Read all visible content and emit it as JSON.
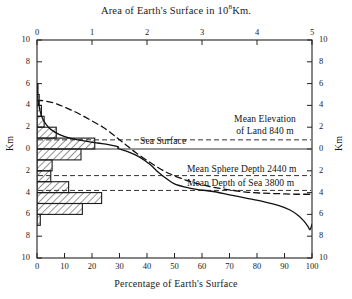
{
  "chart_data": {
    "type": "area",
    "xlabel": "Percentage of Earth's Surface",
    "ylabel": "Km",
    "ylabel_right": "Km",
    "xlim": [
      0,
      100
    ],
    "ylim": [
      -10,
      10
    ],
    "grid": false,
    "legend": "none",
    "top_axis": {
      "label": "Area of Earth's Surface in 10⁸Km.",
      "ticks": [
        "0",
        "1",
        "2",
        "3",
        "4",
        "5"
      ],
      "values": [
        0,
        1,
        2,
        3,
        4,
        5
      ],
      "range": [
        0,
        5
      ]
    },
    "bottom_axis": {
      "label": "Percentage of Earth's Surface",
      "ticks": [
        "0",
        "10",
        "20",
        "30",
        "40",
        "50",
        "60",
        "70",
        "80",
        "90",
        "100"
      ],
      "values": [
        0,
        10,
        20,
        30,
        40,
        50,
        60,
        70,
        80,
        90,
        100
      ],
      "range": [
        0,
        100
      ]
    },
    "left_axis": {
      "label": "Km",
      "ticks": [
        "10",
        "8",
        "6",
        "4",
        "2",
        "0",
        "2",
        "4",
        "6",
        "8",
        "10"
      ],
      "values": [
        10,
        8,
        6,
        4,
        2,
        0,
        -2,
        -4,
        -6,
        -8,
        -10
      ]
    },
    "right_axis": {
      "label": "Km",
      "ticks": [
        "10",
        "8",
        "6",
        "4",
        "2",
        "0",
        "2",
        "4",
        "6",
        "8",
        "10"
      ],
      "values": [
        10,
        8,
        6,
        4,
        2,
        0,
        -2,
        -4,
        -6,
        -8,
        -10
      ]
    },
    "series": [
      {
        "name": "Hypsographic curve (cumulative percentage of Earth's surface vs elevation)",
        "style": "solid",
        "points": [
          [
            0.0,
            5.5
          ],
          [
            0.3,
            4.6
          ],
          [
            0.7,
            4.0
          ],
          [
            1.2,
            3.4
          ],
          [
            2.0,
            2.8
          ],
          [
            3.2,
            2.3
          ],
          [
            5.0,
            1.8
          ],
          [
            8.0,
            1.35
          ],
          [
            12.0,
            1.0
          ],
          [
            17.0,
            0.75
          ],
          [
            22.0,
            0.55
          ],
          [
            26.0,
            0.4
          ],
          [
            29.5,
            0.2
          ],
          [
            29.5,
            0.05
          ],
          [
            33.0,
            -0.25
          ],
          [
            37.0,
            -0.7
          ],
          [
            41.0,
            -1.4
          ],
          [
            44.0,
            -2.1
          ],
          [
            47.0,
            -2.7
          ],
          [
            50.0,
            -3.2
          ],
          [
            54.0,
            -3.5
          ],
          [
            58.0,
            -3.7
          ],
          [
            64.0,
            -3.9
          ],
          [
            70.0,
            -4.2
          ],
          [
            76.0,
            -4.5
          ],
          [
            82.0,
            -4.8
          ],
          [
            88.0,
            -5.2
          ],
          [
            92.0,
            -5.6
          ],
          [
            95.0,
            -6.1
          ],
          [
            97.0,
            -6.6
          ],
          [
            98.5,
            -7.1
          ],
          [
            99.3,
            -7.4
          ],
          [
            100.0,
            -6.9
          ]
        ]
      },
      {
        "name": "Cumulative area curve (10^8 Km. scale, top axis)",
        "style": "dashed",
        "points": [
          [
            0.0,
            4.4
          ],
          [
            1.5,
            4.45
          ],
          [
            4.0,
            4.35
          ],
          [
            7.0,
            4.15
          ],
          [
            10.0,
            3.85
          ],
          [
            13.5,
            3.45
          ],
          [
            17.0,
            3.0
          ],
          [
            20.5,
            2.5
          ],
          [
            24.0,
            2.0
          ],
          [
            27.0,
            1.45
          ],
          [
            30.0,
            0.85
          ],
          [
            33.0,
            0.25
          ],
          [
            36.0,
            -0.35
          ],
          [
            40.0,
            -1.05
          ],
          [
            44.0,
            -1.7
          ],
          [
            48.0,
            -2.25
          ],
          [
            53.0,
            -2.75
          ],
          [
            58.0,
            -3.15
          ],
          [
            64.0,
            -3.5
          ],
          [
            70.0,
            -3.75
          ],
          [
            76.0,
            -3.95
          ],
          [
            82.0,
            -4.05
          ],
          [
            88.0,
            -4.1
          ],
          [
            94.0,
            -4.15
          ],
          [
            100.0,
            -4.15
          ]
        ]
      }
    ],
    "histogram": {
      "name": "Area distribution by elevation interval",
      "orientation": "horizontal",
      "bin_height_km": 1,
      "hatch": "diagonal",
      "bins": [
        {
          "top_km": 6,
          "bottom_km": 5,
          "value": 0.2
        },
        {
          "top_km": 5,
          "bottom_km": 4,
          "value": 0.8
        },
        {
          "top_km": 4,
          "bottom_km": 3,
          "value": 1.6
        },
        {
          "top_km": 3,
          "bottom_km": 2,
          "value": 2.6
        },
        {
          "top_km": 2,
          "bottom_km": 1,
          "value": 7.0
        },
        {
          "top_km": 1,
          "bottom_km": 0,
          "value": 21.0
        },
        {
          "top_km": 0,
          "bottom_km": -1,
          "value": 16.0
        },
        {
          "top_km": -1,
          "bottom_km": -2,
          "value": 5.5
        },
        {
          "top_km": -2,
          "bottom_km": -3,
          "value": 5.0
        },
        {
          "top_km": -3,
          "bottom_km": -4,
          "value": 11.5
        },
        {
          "top_km": -4,
          "bottom_km": -5,
          "value": 23.5
        },
        {
          "top_km": -5,
          "bottom_km": -6,
          "value": 16.5
        },
        {
          "top_km": -6,
          "bottom_km": -7,
          "value": 1.2
        }
      ]
    },
    "annotations": [
      {
        "id": "sea-surface",
        "text": "Sea Surface",
        "level_km": 0,
        "line": "solid"
      },
      {
        "id": "mean-elevation-land",
        "text": "Mean  Elevation",
        "text2": "of Land 840 m",
        "level_km": 0.84,
        "line": "dashed"
      },
      {
        "id": "mean-sphere-depth",
        "text": "Mean Sphere Depth 2440 m",
        "level_km": -2.44,
        "line": "dashed"
      },
      {
        "id": "mean-depth-sea",
        "text": "Mean Depth of Sea 3800 m",
        "level_km": -3.8,
        "line": "dashed"
      }
    ]
  },
  "labels": {
    "title": "Area of Earth's Surface in 10",
    "title_sup": "8",
    "title_tail": "Km.",
    "xlabel_bottom": "Percentage of Earth's Surface",
    "ylabel_left": "Km",
    "ylabel_right": "Km",
    "sea_surface": "Sea Surface",
    "mean_elev_line1": "Mean  Elevation",
    "mean_elev_line2": "of Land 840 m",
    "mean_sphere": "Mean Sphere Depth 2440 m",
    "mean_sea": "Mean Depth of Sea 3800 m"
  },
  "colors": {
    "axis": "#222222",
    "curve": "#111111",
    "hatch": "#3a3a3a",
    "background": "#ffffff"
  }
}
